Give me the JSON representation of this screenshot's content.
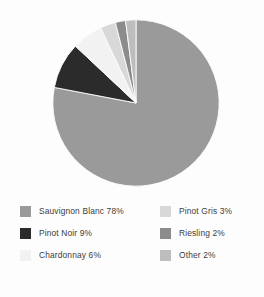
{
  "chart_data": {
    "type": "pie",
    "title": "",
    "subtitle": "",
    "xlabel": "",
    "ylabel": "",
    "grid": false,
    "legend_position": "bottom",
    "start_angle_deg": 0,
    "direction": "clockwise",
    "categories": [
      "Sauvignon Blanc",
      "Pinot Noir",
      "Chardonnay",
      "Pinot Gris",
      "Riesling",
      "Other"
    ],
    "values": [
      78,
      9,
      6,
      3,
      2,
      2
    ],
    "value_suffix": "%",
    "slice_colors": [
      "#9a9a9a",
      "#2b2b2b",
      "#f2f2f2",
      "#d8d8d8",
      "#8c8c8c",
      "#bdbdbd"
    ],
    "slices": [
      {
        "label": "Sauvignon Blanc",
        "value": 78,
        "display": "Sauvignon Blanc 78%",
        "color": "#9a9a9a"
      },
      {
        "label": "Pinot Noir",
        "value": 9,
        "display": "Pinot Noir 9%",
        "color": "#2b2b2b"
      },
      {
        "label": "Chardonnay",
        "value": 6,
        "display": "Chardonnay 6%",
        "color": "#f2f2f2"
      },
      {
        "label": "Pinot Gris",
        "value": 3,
        "display": "Pinot Gris 3%",
        "color": "#d8d8d8"
      },
      {
        "label": "Riesling",
        "value": 2,
        "display": "Riesling 2%",
        "color": "#8c8c8c"
      },
      {
        "label": "Other",
        "value": 2,
        "display": "Other 2%",
        "color": "#bdbdbd"
      }
    ]
  },
  "legend": {
    "left_column": [
      {
        "label": "Sauvignon Blanc 78%",
        "color": "#9a9a9a"
      },
      {
        "label": "Pinot Noir 9%",
        "color": "#2b2b2b"
      },
      {
        "label": "Chardonnay 6%",
        "color": "#f2f2f2"
      }
    ],
    "right_column": [
      {
        "label": "Pinot Gris 3%",
        "color": "#d8d8d8"
      },
      {
        "label": "Riesling 2%",
        "color": "#8c8c8c"
      },
      {
        "label": "Other 2%",
        "color": "#bdbdbd"
      }
    ]
  },
  "theme": {
    "background": "#fdfdfd",
    "text": "#3c3c3c"
  }
}
